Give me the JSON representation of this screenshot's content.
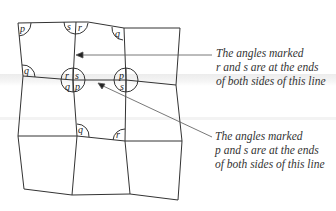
{
  "diagram": {
    "type": "quadrilateral tessellation",
    "angle_labels": {
      "top_left": "p",
      "top_mid_left": "s",
      "top_mid_right": "r",
      "top_right": "q",
      "mid_left": "q",
      "center_tl": "r",
      "center_tr": "s",
      "center_bl": "q",
      "center_br": "p",
      "mid_right_top": "p",
      "mid_right_bottom": "s",
      "lower_mid": "q",
      "lower_right": "r"
    },
    "annotations": [
      {
        "lines": [
          "The angles marked",
          "r and s are at the ends",
          "of both sides of this line"
        ]
      },
      {
        "lines": [
          "The angles marked",
          "p and s are at the ends",
          "of both sides of this line"
        ]
      }
    ],
    "colors": {
      "line": "#333333",
      "text": "#333333",
      "band": "#ececec"
    }
  }
}
